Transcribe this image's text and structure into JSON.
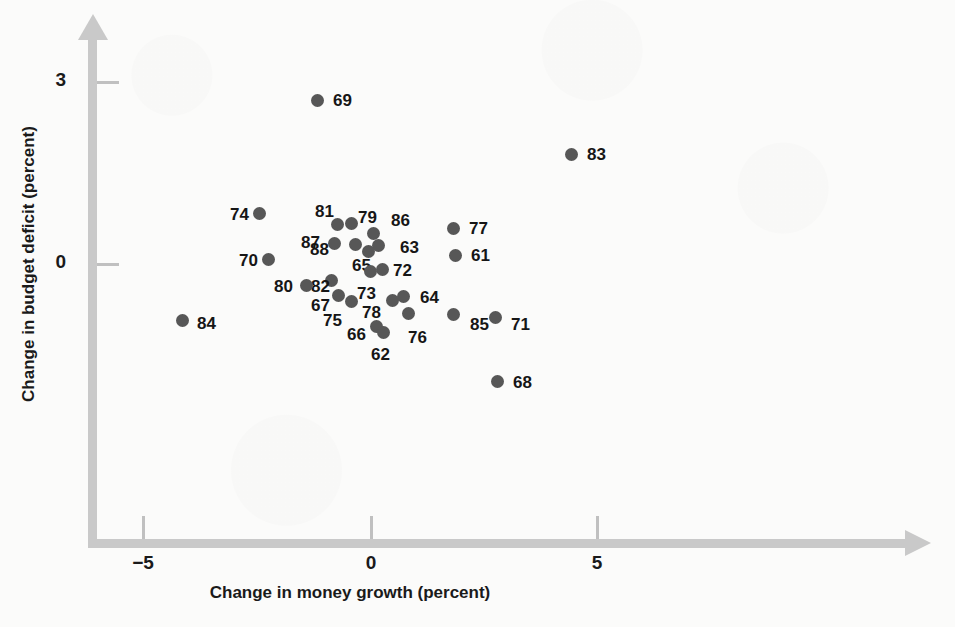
{
  "chart_data": {
    "type": "scatter",
    "title": "",
    "xlabel": "Change in money growth (percent)",
    "ylabel": "Change in budget deficit (percent)",
    "xtick_labels": [
      "−5",
      "0",
      "5"
    ],
    "xtick_values": [
      -5,
      0,
      5
    ],
    "ytick_labels": [
      "3",
      "0"
    ],
    "ytick_values": [
      3,
      0
    ],
    "xlim": [
      -6.3,
      11.9
    ],
    "ylim": [
      -2.6,
      3.6
    ],
    "grid": false,
    "legend": "none",
    "marker_color": "#575757",
    "axis_color": "#c9c9c9",
    "points": [
      {
        "label": "69",
        "x": -0.9,
        "y": 2.7,
        "px": 317,
        "py": 100,
        "lx": 333,
        "ly": 91
      },
      {
        "label": "83",
        "x": 4.7,
        "y": 1.8,
        "px": 571,
        "py": 154,
        "lx": 587,
        "ly": 145
      },
      {
        "label": "74",
        "x": -2.2,
        "y": 0.91,
        "px": 259,
        "py": 213,
        "lx": 230,
        "ly": 205
      },
      {
        "label": "81",
        "x": -0.49,
        "y": 0.72,
        "px": 337,
        "py": 224,
        "lx": 315,
        "ly": 202
      },
      {
        "label": "79",
        "x": -0.19,
        "y": 0.74,
        "px": 351,
        "py": 223,
        "lx": 358,
        "ly": 208
      },
      {
        "label": "86",
        "x": 0.29,
        "y": 0.58,
        "px": 373,
        "py": 233,
        "lx": 391,
        "ly": 211
      },
      {
        "label": "77",
        "x": 2.05,
        "y": 0.66,
        "px": 453,
        "py": 228,
        "lx": 469,
        "ly": 219
      },
      {
        "label": "87",
        "x": -0.55,
        "y": 0.42,
        "px": 334,
        "py": 243,
        "lx": 301,
        "ly": 233
      },
      {
        "label": "88",
        "x": -0.1,
        "y": 0.4,
        "px": 355,
        "py": 244,
        "lx": 310,
        "ly": 240
      },
      {
        "label": "63",
        "x": 0.41,
        "y": 0.38,
        "px": 378,
        "py": 245,
        "lx": 400,
        "ly": 238
      },
      {
        "label": "61",
        "x": 2.1,
        "y": 0.16,
        "px": 455,
        "py": 255,
        "lx": 471,
        "ly": 246
      },
      {
        "label": "70",
        "x": -2.02,
        "y": 0.07,
        "px": 268,
        "py": 259,
        "lx": 239,
        "ly": 251
      },
      {
        "label": "65",
        "x": 0.18,
        "y": 0.25,
        "px": 368,
        "py": 251,
        "lx": 352,
        "ly": 256
      },
      {
        "label": "72",
        "x": 0.48,
        "y": -0.13,
        "px": 382,
        "py": 269,
        "lx": 393,
        "ly": 261
      },
      {
        "label": "73",
        "x": 0.21,
        "y": -0.18,
        "px": 370,
        "py": 271,
        "lx": 357,
        "ly": 284
      },
      {
        "label": "82",
        "x": -0.64,
        "y": -0.34,
        "px": 331,
        "py": 280,
        "lx": 311,
        "ly": 277
      },
      {
        "label": "80",
        "x": -1.18,
        "y": -0.45,
        "px": 306,
        "py": 285,
        "lx": 274,
        "ly": 277
      },
      {
        "label": "67",
        "x": -0.48,
        "y": -0.66,
        "px": 338,
        "py": 295,
        "lx": 311,
        "ly": 296
      },
      {
        "label": "64",
        "x": 0.95,
        "y": -0.68,
        "px": 403,
        "py": 296,
        "lx": 420,
        "ly": 288
      },
      {
        "label": "75",
        "x": -0.2,
        "y": -0.79,
        "px": 351,
        "py": 301,
        "lx": 323,
        "ly": 311
      },
      {
        "label": "78",
        "x": 0.7,
        "y": -0.77,
        "px": 392,
        "py": 300,
        "lx": 362,
        "ly": 303
      },
      {
        "label": "76",
        "x": 1.05,
        "y": -1.05,
        "px": 408,
        "py": 313,
        "lx": 408,
        "ly": 328
      },
      {
        "label": "85",
        "x": 2.05,
        "y": -1.07,
        "px": 453,
        "py": 314,
        "lx": 470,
        "ly": 315
      },
      {
        "label": "71",
        "x": 2.98,
        "y": -1.12,
        "px": 495,
        "py": 317,
        "lx": 511,
        "ly": 315
      },
      {
        "label": "84",
        "x": -4.12,
        "y": -1.2,
        "px": 182,
        "py": 320,
        "lx": 197,
        "ly": 314
      },
      {
        "label": "66",
        "x": 0.34,
        "y": -1.32,
        "px": 376,
        "py": 326,
        "lx": 347,
        "ly": 325
      },
      {
        "label": "62",
        "x": 0.5,
        "y": -1.45,
        "px": 383,
        "py": 332,
        "lx": 371,
        "ly": 345
      },
      {
        "label": "68",
        "x": 3.03,
        "y": -2.05,
        "px": 497,
        "py": 381,
        "lx": 513,
        "ly": 373
      }
    ]
  },
  "axes": {
    "xticks": [
      {
        "label": "−5",
        "px": 143
      },
      {
        "label": "0",
        "px": 371
      },
      {
        "label": "5",
        "px": 597
      }
    ],
    "yticks": [
      {
        "label": "3",
        "py": 82
      },
      {
        "label": "0",
        "py": 264
      }
    ]
  }
}
